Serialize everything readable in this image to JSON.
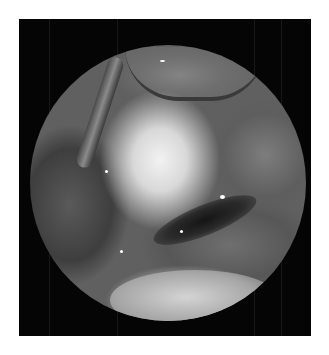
{
  "image": {
    "description": "Grayscale endoscopic/laparoscopic view inside a circular scope field on a black rectangular background",
    "colors": {
      "page_background": "#ffffff",
      "frame_background": "#050505",
      "highlight_tissue": "#f2f2f2",
      "mid_tissue": "#606060",
      "dark_region": "#151515"
    },
    "regions": [
      {
        "name": "bright-central-tissue",
        "position": "upper-center"
      },
      {
        "name": "instrument-shaft",
        "position": "upper-left"
      },
      {
        "name": "tissue-fold",
        "position": "top-center"
      },
      {
        "name": "dark-bleeding-area",
        "position": "center-right"
      },
      {
        "name": "lower-bright-tissue-mass",
        "position": "bottom-center"
      },
      {
        "name": "scope-notch",
        "position": "bottom-right of circle"
      }
    ]
  }
}
